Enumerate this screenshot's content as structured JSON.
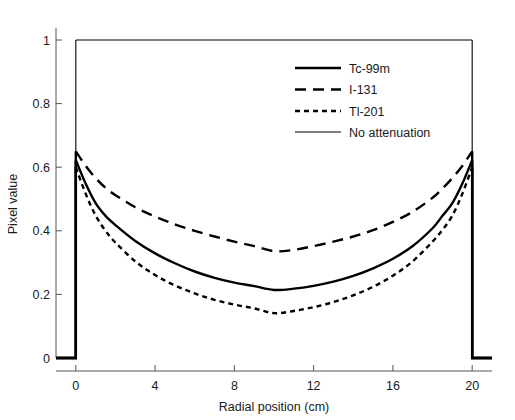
{
  "chart_data": {
    "type": "line",
    "title": "",
    "xlabel": "Radial position (cm)",
    "ylabel": "Pixel value",
    "xlim": [
      -1,
      21
    ],
    "ylim": [
      0,
      1.06
    ],
    "xticks": [
      0,
      4,
      8,
      12,
      16,
      20
    ],
    "xtick_labels": [
      "0",
      "4",
      "8",
      "12",
      "16",
      "20"
    ],
    "yticks": [
      0,
      0.2,
      0.4,
      0.6,
      0.8,
      1
    ],
    "ytick_labels": [
      "0",
      "0.2",
      "0.4",
      "0.6",
      "0.8",
      "1"
    ],
    "grid": false,
    "legend_position": "upper center",
    "x": [
      -1,
      0,
      0.5,
      1,
      1.5,
      2,
      3,
      4,
      5,
      6,
      7,
      8,
      9,
      10,
      11,
      12,
      13,
      14,
      15,
      16,
      17,
      18,
      18.5,
      19,
      19.5,
      20,
      21
    ],
    "series": [
      {
        "name": "Tc-99m",
        "style": "solid-thick",
        "values": [
          0,
          0.622,
          0.548,
          0.487,
          0.447,
          0.418,
          0.368,
          0.329,
          0.298,
          0.272,
          0.252,
          0.237,
          0.226,
          0.214,
          0.218,
          0.227,
          0.24,
          0.258,
          0.282,
          0.312,
          0.352,
          0.408,
          0.447,
          0.487,
          0.548,
          0.622,
          0
        ]
      },
      {
        "name": "I-131",
        "style": "dashed-long",
        "values": [
          0,
          0.65,
          0.604,
          0.566,
          0.535,
          0.512,
          0.474,
          0.445,
          0.42,
          0.4,
          0.382,
          0.366,
          0.352,
          0.336,
          0.34,
          0.352,
          0.366,
          0.382,
          0.402,
          0.428,
          0.46,
          0.504,
          0.533,
          0.566,
          0.604,
          0.65,
          0
        ]
      },
      {
        "name": "Tl-201",
        "style": "dashed-short",
        "values": [
          0,
          0.6,
          0.516,
          0.448,
          0.4,
          0.363,
          0.304,
          0.261,
          0.228,
          0.203,
          0.183,
          0.168,
          0.156,
          0.141,
          0.148,
          0.16,
          0.176,
          0.197,
          0.224,
          0.259,
          0.304,
          0.366,
          0.403,
          0.448,
          0.516,
          0.6,
          0
        ]
      },
      {
        "name": "No attenuation",
        "style": "solid-thin",
        "values": [
          0,
          1.0,
          1.0,
          1.0,
          1.0,
          1.0,
          1.0,
          1.0,
          1.0,
          1.0,
          1.0,
          1.0,
          1.0,
          1.0,
          1.0,
          1.0,
          1.0,
          1.0,
          1.0,
          1.0,
          1.0,
          1.0,
          1.0,
          1.0,
          1.0,
          1.0,
          0
        ]
      }
    ]
  },
  "legend": {
    "items": [
      {
        "label": "Tc-99m"
      },
      {
        "label": "I-131"
      },
      {
        "label": "Tl-201"
      },
      {
        "label": "No attenuation"
      }
    ]
  },
  "axes": {
    "x_title": "Radial position (cm)",
    "y_title": "Pixel value"
  },
  "colors": {
    "line": "#000000",
    "axis": "#555555",
    "text": "#1a1a1a",
    "background": "#ffffff"
  }
}
